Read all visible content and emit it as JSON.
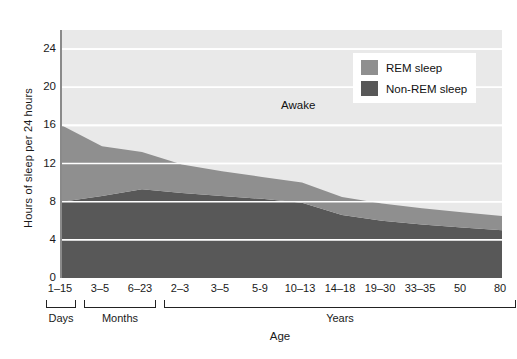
{
  "chart_data": {
    "type": "area",
    "title": "",
    "subtitle": "",
    "xlabel": "Age",
    "ylabel": "Hours of sleep per 24 hours",
    "ylim": [
      0,
      26
    ],
    "yticks": [
      0,
      4,
      8,
      12,
      16,
      20,
      24
    ],
    "ytick_labels": [
      "0",
      "4",
      "8",
      "12",
      "16",
      "20",
      "24"
    ],
    "grid": true,
    "grid_axis": "y",
    "legend_position": "top-right",
    "stacked": true,
    "categories": [
      "1–15",
      "3–5",
      "6–23",
      "2–3",
      "3–5",
      "5-9",
      "10–13",
      "14–18",
      "19–30",
      "33–35",
      "50",
      "80"
    ],
    "category_groups": [
      {
        "label": "Days",
        "from": "1–15",
        "to": "1–15"
      },
      {
        "label": "Months",
        "from": "3–5",
        "to": "6–23"
      },
      {
        "label": "Years",
        "from": "2–3",
        "to": "80"
      }
    ],
    "series": [
      {
        "name": "Non-REM sleep",
        "color": "#585858",
        "values": [
          8.0,
          8.6,
          9.3,
          8.9,
          8.6,
          8.3,
          7.9,
          6.6,
          6.0,
          5.6,
          5.3,
          5.0
        ]
      },
      {
        "name": "REM sleep",
        "color": "#8f8f8f",
        "values": [
          8.0,
          5.2,
          3.9,
          3.0,
          2.6,
          2.3,
          2.1,
          1.9,
          1.8,
          1.7,
          1.6,
          1.5
        ]
      }
    ],
    "total_sleep": [
      16.0,
      13.8,
      13.2,
      11.9,
      11.2,
      10.6,
      10.0,
      8.5,
      7.8,
      7.3,
      6.9,
      6.5
    ],
    "annotations": [
      {
        "text": "Awake",
        "x_category": "10–13",
        "y_value": 18.0
      }
    ]
  },
  "legend": {
    "items": [
      {
        "label": "REM sleep",
        "color": "#8f8f8f",
        "swatch_name": "rem-sleep-swatch"
      },
      {
        "label": "Non-REM sleep",
        "color": "#585858",
        "swatch_name": "non-rem-sleep-swatch"
      }
    ]
  },
  "axes": {
    "y_title": "Hours of sleep per 24 hours",
    "x_title": "Age"
  },
  "annotation": {
    "awake": "Awake"
  },
  "colors": {
    "awake_area": "#e9e9e9",
    "rem": "#8f8f8f",
    "non_rem": "#585858",
    "gridline": "#ffffff",
    "axis": "#8a8a8a",
    "text": "#1a1a1a"
  }
}
